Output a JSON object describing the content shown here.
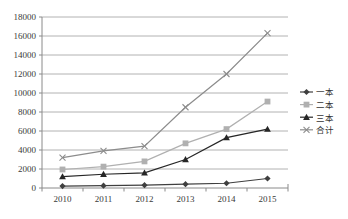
{
  "chart_data": {
    "type": "line",
    "title": "",
    "xlabel": "",
    "ylabel": "",
    "categories": [
      "2010",
      "2011",
      "2012",
      "2013",
      "2014",
      "2015"
    ],
    "ylim": [
      0,
      18000
    ],
    "ytick_step": 2000,
    "yticks": [
      "0",
      "2000",
      "4000",
      "6000",
      "8000",
      "10000",
      "12000",
      "14000",
      "16000",
      "18000"
    ],
    "grid": "horizontal",
    "legend_position": "right",
    "series": [
      {
        "name": "一本",
        "marker": "diamond",
        "color": "#3f3f3f",
        "values": [
          200,
          250,
          300,
          400,
          500,
          1000
        ]
      },
      {
        "name": "二本",
        "marker": "square",
        "color": "#b0b0b0",
        "values": [
          1950,
          2250,
          2800,
          4700,
          6200,
          9100
        ]
      },
      {
        "name": "三本",
        "marker": "triangle",
        "color": "#262626",
        "values": [
          1200,
          1450,
          1600,
          3000,
          5300,
          6200
        ]
      },
      {
        "name": "合计",
        "marker": "x",
        "color": "#8c8c8c",
        "values": [
          3200,
          3900,
          4400,
          8500,
          12000,
          16300
        ]
      }
    ]
  },
  "legend": {
    "items": [
      {
        "label": "一本"
      },
      {
        "label": "二本"
      },
      {
        "label": "三本"
      },
      {
        "label": "合计"
      }
    ]
  },
  "colors": {
    "grid": "#a9a9a9",
    "axis": "#8a8a8a",
    "text": "#3a3a3a",
    "background": "#ffffff"
  }
}
